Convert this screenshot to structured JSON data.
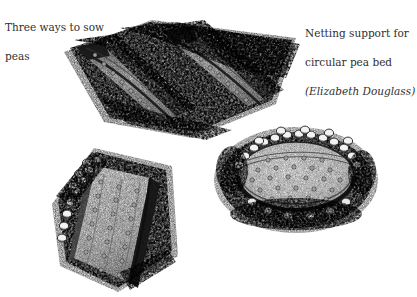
{
  "figure": {
    "background_color": "#ffffff",
    "ink_color": "#1a1a1a",
    "width": 417,
    "height": 297,
    "medium": "pen-and-ink stipple illustration"
  },
  "captions": {
    "left": {
      "name": "three-ways-to-sow-peas-caption",
      "line1": "Three ways to sow",
      "line2": "peas",
      "full_text": "Three ways to sow peas"
    },
    "right": {
      "name": "netting-support-caption",
      "line1": "Netting support for",
      "line2": "circular pea bed",
      "line3": "(Elizabeth Douglass)",
      "attribution": "Elizabeth Douglass",
      "full_text": "Netting support for circular pea bed (Elizabeth Douglass)"
    }
  },
  "illustrations": [
    {
      "id": "narrow-drills",
      "label": "Two narrow V-shaped seed drills sown with peas",
      "position": "top-center",
      "method": "narrow drill",
      "rows": 2,
      "seed_rows_per_drill": 1
    },
    {
      "id": "wide-flat-trench",
      "label": "Wide flat-bottomed trench with peas sown in a staggered grid",
      "position": "bottom-left",
      "method": "wide flat drill",
      "seed_rows": 3
    },
    {
      "id": "circular-pea-bed",
      "label": "Circular sunken pea bed with raised clod rim and netting hoop",
      "position": "right",
      "method": "circular bed",
      "shape": "oval"
    }
  ]
}
